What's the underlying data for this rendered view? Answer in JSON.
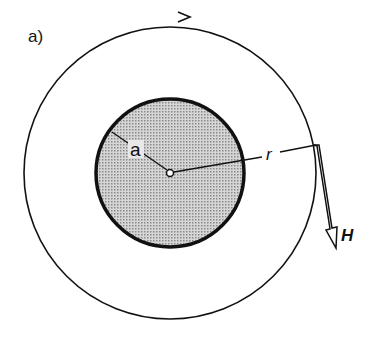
{
  "figure": {
    "panel_label": "a)",
    "radius_inner_label": "a",
    "radius_outer_label": "r",
    "field_label": "H",
    "colors": {
      "ink": "#111111",
      "fill": "#bdbdbd"
    }
  }
}
